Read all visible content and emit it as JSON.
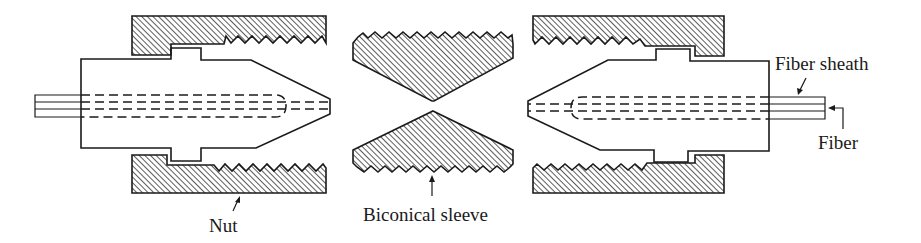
{
  "diagram": {
    "colors": {
      "line": "#1a1a1a",
      "hatch": "#333333",
      "background": "#ffffff"
    },
    "labels": {
      "nut": "Nut",
      "biconical_sleeve": "Biconical sleeve",
      "fiber_sheath": "Fiber sheath",
      "fiber": "Fiber"
    },
    "components": [
      {
        "id": "left-plug",
        "name": "Left connector plug"
      },
      {
        "id": "left-nut",
        "name": "Left threaded nut"
      },
      {
        "id": "biconical-sleeve",
        "name": "Biconical sleeve (threaded)"
      },
      {
        "id": "right-nut",
        "name": "Right threaded nut"
      },
      {
        "id": "right-plug",
        "name": "Right connector plug"
      }
    ]
  }
}
